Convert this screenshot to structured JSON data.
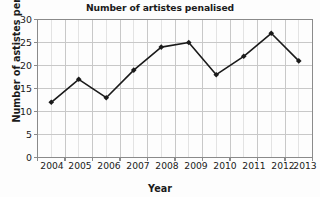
{
  "chart_data": {
    "type": "line",
    "title": "Number of artistes penalised",
    "xlabel": "Year",
    "ylabel": "Number of astistes penalized",
    "categories": [
      "2004",
      "2005",
      "2006",
      "2007",
      "2008",
      "2009",
      "2010",
      "2011",
      "2012",
      "2013"
    ],
    "values": [
      12,
      17,
      13,
      19,
      24,
      25,
      18,
      22,
      27,
      21
    ],
    "series": [
      {
        "name": "Number of artistes penalised",
        "values": [
          12,
          17,
          13,
          19,
          24,
          25,
          18,
          22,
          27,
          21
        ]
      }
    ],
    "yticks": [
      0,
      5,
      10,
      15,
      20,
      25,
      30
    ],
    "ytick_labels": [
      "0",
      "5",
      "10",
      "15",
      "20",
      "25",
      "30"
    ],
    "ylim": [
      0,
      30
    ],
    "xlim": [
      "2004",
      "2013"
    ],
    "grid": true,
    "minor_grid": true,
    "legend": false,
    "legend_position": "none",
    "marker": "diamond",
    "line_color": "#1a1a1a",
    "marker_color": "#1a1a1a",
    "grid_color": "#c8c8c8",
    "minor_grid_color": "#e3e3e3",
    "frame_color": "#8a8a8a",
    "background_color": "#fdfdfd",
    "text_color": "#1a1a1a"
  }
}
